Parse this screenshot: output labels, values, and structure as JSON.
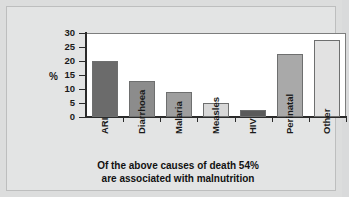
{
  "chart_data": {
    "type": "bar",
    "title": "",
    "xlabel": "",
    "ylabel": "%",
    "ylim": [
      0,
      30
    ],
    "ytick_values": [
      30,
      25,
      20,
      15,
      10,
      5,
      0
    ],
    "grid": false,
    "legend": "none",
    "categories": [
      "ARI",
      "Diarrhoea",
      "Malaria",
      "Measles",
      "HIV",
      "Perinatal",
      "Other"
    ],
    "values": [
      20,
      13,
      9,
      5,
      2.5,
      22.5,
      27.5
    ],
    "bar_colors": [
      "#6b6b6b",
      "#8c8c8c",
      "#9e9e9e",
      "#d8d8d8",
      "#5a5a5a",
      "#a9a9a9",
      "#e2e2e2"
    ],
    "annotations": [
      "Of the above causes of death 54%",
      "are associated with malnutrition"
    ]
  },
  "caption": {
    "line1": "Of the above causes of death 54%",
    "line2": "are associated with malnutrition"
  },
  "axis": {
    "y_label": "%",
    "y_ticks": [
      "30",
      "25",
      "20",
      "15",
      "10",
      "5",
      "0"
    ]
  },
  "colors": {
    "page_background": "#dcdddd",
    "card_background": "#e3e4e4",
    "plot_background": "#ffffff",
    "axis": "#2b2b2b",
    "text": "#111111"
  }
}
